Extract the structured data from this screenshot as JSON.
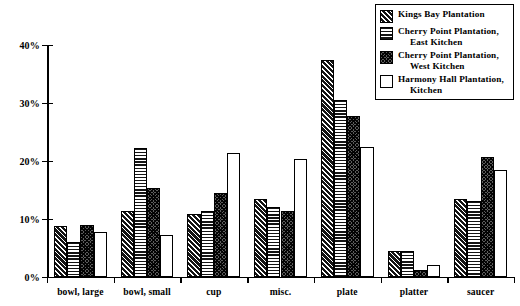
{
  "chart_data": {
    "type": "bar",
    "title": "",
    "subtitle": "",
    "xlabel": "",
    "ylabel": "",
    "ylim": [
      0,
      40
    ],
    "ytick_labels": [
      "0%",
      "10%",
      "20%",
      "30%",
      "40%"
    ],
    "ytick_values": [
      0,
      10,
      20,
      30,
      40
    ],
    "grid": false,
    "legend_position": "top-right",
    "categories": [
      "bowl, large",
      "bowl, small",
      "cup",
      "misc.",
      "plate",
      "platter",
      "saucer"
    ],
    "series": [
      {
        "name": "Kings Bay Plantation",
        "pattern": "diagonal-hatch",
        "values": [
          8.8,
          11.4,
          10.8,
          13.5,
          37.5,
          4.5,
          13.5
        ]
      },
      {
        "name": "Cherry Point Plantation, East Kitchen",
        "name_line1": "Cherry Point Plantation,",
        "name_line2": "East Kitchen",
        "pattern": "horizontal-lines",
        "values": [
          6.0,
          22.2,
          11.4,
          12.1,
          30.6,
          4.5,
          13.1
        ]
      },
      {
        "name": "Cherry Point Plantation, West Kitchen",
        "name_line1": "Cherry Point Plantation,",
        "name_line2": "West Kitchen",
        "pattern": "cross-hatch",
        "values": [
          9.0,
          15.3,
          14.5,
          11.3,
          27.8,
          1.2,
          20.7
        ]
      },
      {
        "name": "Harmony Hall Plantation, Kitchen",
        "name_line1": "Harmony Hall Plantation,",
        "name_line2": "Kitchen",
        "pattern": "solid-white",
        "values": [
          7.8,
          7.3,
          21.3,
          20.3,
          22.5,
          2.0,
          18.4
        ]
      }
    ]
  },
  "legend": {
    "items": [
      {
        "label_line1": "Kings Bay Plantation",
        "label_line2": "",
        "pattern": "diagonal-hatch"
      },
      {
        "label_line1": "Cherry Point Plantation,",
        "label_line2": "East Kitchen",
        "pattern": "horizontal-lines"
      },
      {
        "label_line1": "Cherry Point Plantation,",
        "label_line2": "West Kitchen",
        "pattern": "cross-hatch"
      },
      {
        "label_line1": "Harmony Hall Plantation,",
        "label_line2": "Kitchen",
        "pattern": "solid-white"
      }
    ]
  },
  "colors": {
    "ink": "#000000",
    "background": "#ffffff",
    "bar_dark": "#1a1a1a",
    "bar_mid": "#5c5c5c",
    "bar_light": "#ffffff"
  }
}
